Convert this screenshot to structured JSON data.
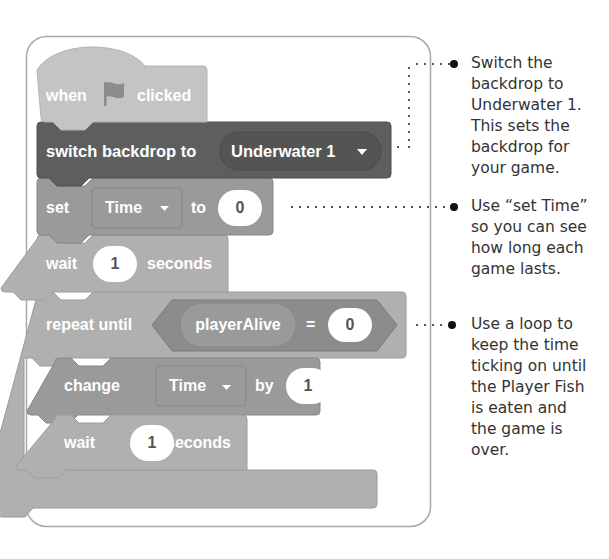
{
  "script": {
    "hat_block": {
      "when_label": "when",
      "flag_icon": "green-flag-icon",
      "clicked_label": "clicked"
    },
    "switch_backdrop_block": {
      "label": "switch backdrop to",
      "dropdown_value": "Underwater 1"
    },
    "set_block": {
      "label": "set",
      "variable": "Time",
      "to_label": "to",
      "value": "0"
    },
    "wait_block_1": {
      "label": "wait",
      "value": "1",
      "unit": "seconds"
    },
    "repeat_until_block": {
      "label": "repeat until",
      "condition": {
        "left": "playerAlive",
        "operator": "=",
        "right": "0"
      },
      "loop_icon": "loop-arrow-icon"
    },
    "change_block": {
      "label": "change",
      "variable": "Time",
      "by_label": "by",
      "value": "1"
    },
    "wait_block_2": {
      "label": "wait",
      "value": "1",
      "unit": "seconds"
    }
  },
  "callouts": [
    {
      "lines": [
        "Switch the",
        "backdrop to",
        "Underwater 1.",
        "This sets the",
        "backdrop for",
        "your game."
      ]
    },
    {
      "lines": [
        "Use “set Time”",
        "so you can see",
        "how long each",
        "game lasts."
      ]
    },
    {
      "lines": [
        "Use a loop to",
        "keep the time",
        "ticking on until",
        "the Player Fish",
        "is eaten and",
        "the game is",
        "over."
      ]
    }
  ],
  "colors": {
    "frame": "#a8a8a8",
    "hat_block": "#c4c4c4",
    "switch_block": "#5e5e5e",
    "set_block": "#9a9a9a",
    "wait_block": "#b0b0b0",
    "repeat_block": "#b0b0b0",
    "condition": "#8c8c8c",
    "callout_dot": "#111111"
  }
}
